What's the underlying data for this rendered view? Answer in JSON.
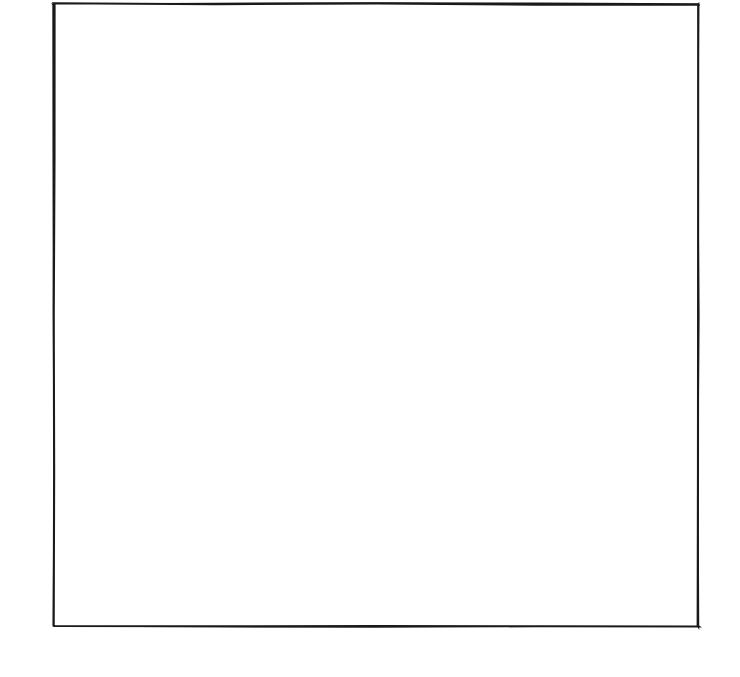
{
  "figure": {
    "canvas": {
      "width": 740,
      "height": 677
    },
    "colors": {
      "ink": "#1a1a1a",
      "block_line": "#262626",
      "patch_line": "#333333",
      "background": "#ffffff",
      "shaded_patch": "#9a9a9a",
      "light_patch": "#ffffff"
    }
  },
  "quilt": {
    "outer_binding": {
      "x": 54,
      "y": 4,
      "width": 644,
      "height": 622
    },
    "inner_top": {
      "x": 92,
      "y": 42,
      "width": 568,
      "height": 541
    },
    "grid": {
      "rows": 7,
      "cols": 7,
      "cell_width": 81.1,
      "cell_height": 77.3
    },
    "block_types": {
      "plain": "plain-square",
      "patch": "double-nine-patch"
    },
    "layout": [
      [
        "plain",
        "patch",
        "plain",
        "patch",
        "plain",
        "patch",
        "plain"
      ],
      [
        "patch",
        "plain",
        "patch",
        "plain",
        "patch",
        "plain",
        "patch"
      ],
      [
        "plain",
        "patch",
        "plain",
        "patch",
        "plain",
        "patch",
        "plain"
      ],
      [
        "patch",
        "plain",
        "patch",
        "plain",
        "patch",
        "plain",
        "patch"
      ],
      [
        "plain",
        "patch",
        "plain",
        "patch",
        "plain",
        "patch",
        "plain"
      ],
      [
        "patch",
        "plain",
        "patch",
        "plain",
        "patch",
        "plain",
        "patch"
      ],
      [
        "plain",
        "patch",
        "plain",
        "patch",
        "plain",
        "patch",
        "plain"
      ]
    ],
    "shaded_blocks": [
      {
        "row": 0,
        "col": 3,
        "motif": "apex-down"
      },
      {
        "row": 1,
        "col": 2,
        "motif": "diag-up"
      },
      {
        "row": 1,
        "col": 4,
        "motif": "diag-down"
      },
      {
        "row": 2,
        "col": 1,
        "motif": "diag-up"
      },
      {
        "row": 2,
        "col": 5,
        "motif": "diag-down"
      },
      {
        "row": 3,
        "col": 0,
        "motif": "vertex-left"
      },
      {
        "row": 3,
        "col": 6,
        "motif": "vertex-right"
      },
      {
        "row": 4,
        "col": 1,
        "motif": "diag-down"
      },
      {
        "row": 4,
        "col": 5,
        "motif": "diag-up"
      },
      {
        "row": 5,
        "col": 2,
        "motif": "diag-down"
      },
      {
        "row": 5,
        "col": 4,
        "motif": "diag-up"
      },
      {
        "row": 6,
        "col": 3,
        "motif": "apex-up"
      }
    ],
    "motif_shaded_cells": {
      "apex-down": [
        [
          2,
          0
        ],
        [
          1,
          1
        ],
        [
          0,
          2
        ],
        [
          1,
          3
        ],
        [
          2,
          4
        ],
        [
          3,
          1
        ],
        [
          3,
          3
        ]
      ],
      "apex-up": [
        [
          1,
          0
        ],
        [
          2,
          1
        ],
        [
          3,
          2
        ],
        [
          2,
          3
        ],
        [
          1,
          4
        ],
        [
          0,
          1
        ],
        [
          0,
          3
        ]
      ],
      "diag-up": [
        [
          4,
          0
        ],
        [
          3,
          1
        ],
        [
          2,
          2
        ],
        [
          1,
          3
        ],
        [
          0,
          4
        ]
      ],
      "diag-down": [
        [
          0,
          0
        ],
        [
          1,
          1
        ],
        [
          2,
          2
        ],
        [
          3,
          3
        ],
        [
          4,
          4
        ]
      ],
      "vertex-left": [
        [
          0,
          4
        ],
        [
          1,
          3
        ],
        [
          2,
          2
        ],
        [
          3,
          3
        ],
        [
          4,
          4
        ]
      ],
      "vertex-right": [
        [
          0,
          0
        ],
        [
          1,
          1
        ],
        [
          2,
          2
        ],
        [
          3,
          1
        ],
        [
          4,
          0
        ]
      ]
    },
    "double_nine_patch": {
      "structure": "3x3 arrangement: four-patch units at the four corners and the center; plain rectangles at the four side positions",
      "four_patch_positions": [
        "top-left",
        "top-right",
        "center",
        "bottom-left",
        "bottom-right"
      ],
      "plain_positions": [
        "top-center",
        "middle-left",
        "middle-right",
        "bottom-center"
      ],
      "units_per_side": 5
    },
    "counts": {
      "total_blocks": 49,
      "plain_squares": 25,
      "patch_blocks": 24,
      "blocks_with_shading": 12
    }
  }
}
